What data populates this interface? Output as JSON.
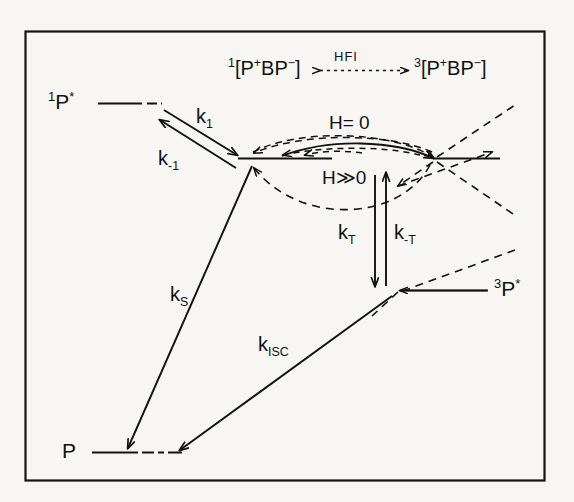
{
  "figure": {
    "kind": "energy-level-kinetics-diagram",
    "background_color": "#f7f6f3",
    "ink_color": "#111111",
    "frame": {
      "x": 25,
      "y": 31,
      "width": 520,
      "height": 450
    }
  },
  "states": {
    "excited_singlet": {
      "label_sup": "1",
      "label_main": "P",
      "label_star": "*",
      "full_text": "1P*"
    },
    "ground": {
      "label_main": "P",
      "full_text": "P"
    },
    "excited_triplet": {
      "label_sup": "3",
      "label_main": "P",
      "label_star": "*",
      "full_text": "3P*"
    },
    "singlet_radical_pair": {
      "label_sup": "1",
      "label_main": "[P",
      "label_plus": "+",
      "label_mid": "BP",
      "label_minus": "−",
      "label_close": "]",
      "full_text": "1[P+BP−]"
    },
    "triplet_radical_pair": {
      "label_sup": "3",
      "label_main": "[P",
      "label_plus": "+",
      "label_mid": "BP",
      "label_minus": "−",
      "label_close": "]",
      "full_text": "3[P+BP−]"
    }
  },
  "coupling": {
    "name": "HFI",
    "arrow_glyph": "⟷"
  },
  "rates": {
    "k1": {
      "base": "k",
      "sub": "1",
      "full_text": "k1"
    },
    "k_minus1": {
      "base": "k",
      "sub": "-1",
      "full_text": "k-1"
    },
    "kS": {
      "base": "k",
      "sub": "S",
      "full_text": "kS"
    },
    "kISC": {
      "base": "k",
      "sub": "ISC",
      "full_text": "kISC"
    },
    "kT": {
      "base": "k",
      "sub": "T",
      "full_text": "kT"
    },
    "k_minusT": {
      "base": "k",
      "sub": "-T",
      "full_text": "k-T"
    }
  },
  "field_conditions": {
    "zero_field": "H= 0",
    "high_field": "H≫0"
  }
}
